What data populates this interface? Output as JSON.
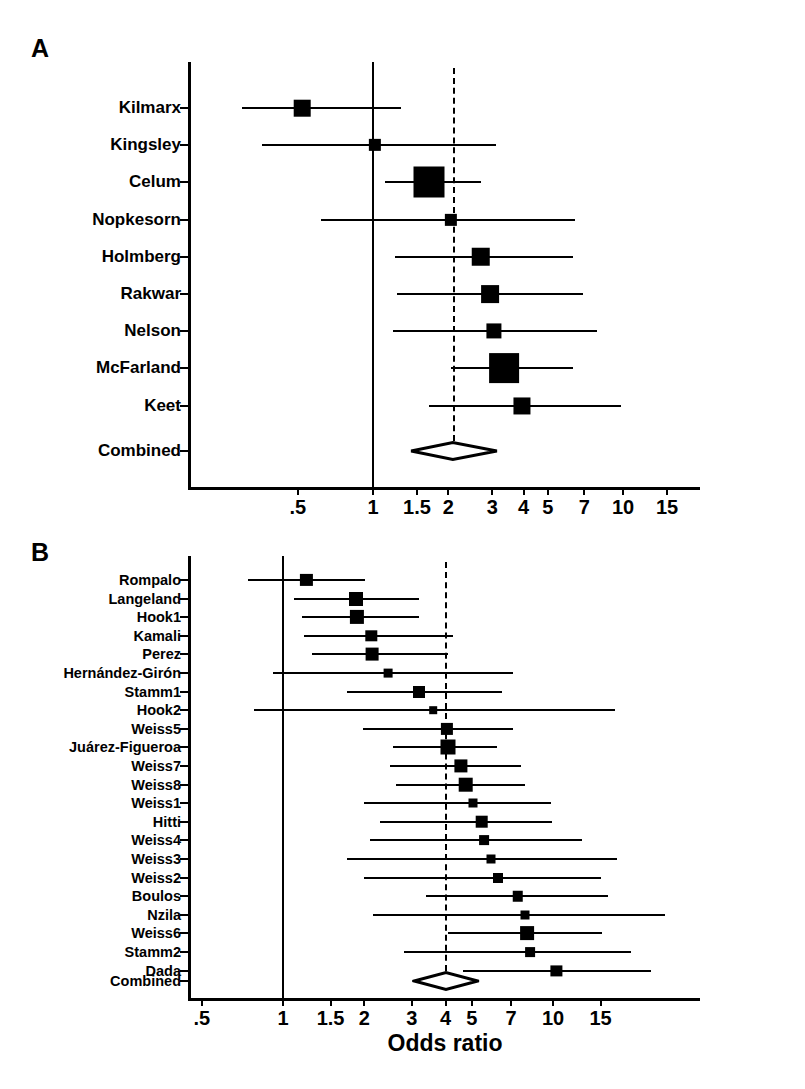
{
  "figure": {
    "axis_title": "Odds ratio",
    "caption": "Fig. 1. Summary of estimates of risk for human immunodeficiency virus infection"
  },
  "chart_data": [
    {
      "type": "forest",
      "panel": "A",
      "panel_letter": "A",
      "title": "",
      "xlabel": "",
      "ylabel": "",
      "xscale": "log",
      "xticks": [
        0.5,
        1,
        1.5,
        2,
        3,
        4,
        5,
        7,
        10,
        15
      ],
      "xtick_labels": [
        ".5",
        "1",
        "1.5",
        "2",
        "3",
        "4",
        "5",
        "7",
        "10",
        "15"
      ],
      "xlim": [
        0.28,
        17.5
      ],
      "reference_line": 1,
      "summary_line": 2.1,
      "categories": [
        "Kilmarx",
        "Kingsley",
        "Celum",
        "Nopkesorn",
        "Holmberg",
        "Rakwar",
        "Nelson",
        "McFarland",
        "Keet",
        "Combined"
      ],
      "points": [
        {
          "study": "Kilmarx",
          "or": 0.52,
          "lo": 0.3,
          "hi": 1.3,
          "weight": 0.4
        },
        {
          "study": "Kingsley",
          "or": 1.02,
          "lo": 0.36,
          "hi": 3.1,
          "weight": 0.22
        },
        {
          "study": "Celum",
          "or": 1.68,
          "lo": 1.12,
          "hi": 2.7,
          "weight": 1.0
        },
        {
          "study": "Nopkesorn",
          "or": 2.05,
          "lo": 0.62,
          "hi": 6.4,
          "weight": 0.22
        },
        {
          "study": "Holmberg",
          "or": 2.7,
          "lo": 1.22,
          "hi": 6.3,
          "weight": 0.48
        },
        {
          "study": "Rakwar",
          "or": 2.95,
          "lo": 1.25,
          "hi": 6.9,
          "weight": 0.45
        },
        {
          "study": "Nelson",
          "or": 3.05,
          "lo": 1.2,
          "hi": 7.9,
          "weight": 0.34
        },
        {
          "study": "McFarland",
          "or": 3.35,
          "lo": 2.05,
          "hi": 6.3,
          "weight": 0.95
        },
        {
          "study": "Keet",
          "or": 3.95,
          "lo": 1.68,
          "hi": 9.8,
          "weight": 0.42
        }
      ],
      "combined": {
        "study": "Combined",
        "or": 2.1,
        "lo": 1.43,
        "hi": 3.15
      }
    },
    {
      "type": "forest",
      "panel": "B",
      "panel_letter": "B",
      "title": "",
      "xlabel": "Odds ratio",
      "ylabel": "",
      "xscale": "log",
      "xticks": [
        0.5,
        1,
        1.5,
        2,
        3,
        4,
        5,
        7,
        10,
        15
      ],
      "xtick_labels": [
        ".5",
        "1",
        "1.5",
        "2",
        "3",
        "4",
        "5",
        "7",
        "10",
        "15"
      ],
      "xlim": [
        0.43,
        28
      ],
      "reference_line": 1,
      "summary_line": 4.0,
      "categories": [
        "Rompalo",
        "Langeland",
        "Hook1",
        "Kamali",
        "Perez",
        "Hernández-Girón",
        "Stamm1",
        "Hook2",
        "Weiss5",
        "Juárez-Figueroa",
        "Weiss7",
        "Weiss8",
        "Weiss1",
        "Hitti",
        "Weiss4",
        "Weiss3",
        "Weiss2",
        "Boulos",
        "Nzila",
        "Weiss6",
        "Stamm2",
        "Dada",
        "Combined"
      ],
      "points": [
        {
          "study": "Rompalo",
          "or": 1.22,
          "lo": 0.74,
          "hi": 2.02,
          "weight": 0.72
        },
        {
          "study": "Langeland",
          "or": 1.87,
          "lo": 1.1,
          "hi": 3.2,
          "weight": 0.9
        },
        {
          "study": "Hook1",
          "or": 1.88,
          "lo": 1.18,
          "hi": 3.2,
          "weight": 0.92
        },
        {
          "study": "Kamali",
          "or": 2.12,
          "lo": 1.2,
          "hi": 4.25,
          "weight": 0.64
        },
        {
          "study": "Perez",
          "or": 2.14,
          "lo": 1.28,
          "hi": 4.1,
          "weight": 0.78
        },
        {
          "study": "Hernández-Girón",
          "or": 2.45,
          "lo": 0.92,
          "hi": 7.1,
          "weight": 0.38
        },
        {
          "study": "Stamm1",
          "or": 3.2,
          "lo": 1.72,
          "hi": 6.5,
          "weight": 0.7
        },
        {
          "study": "Hook2",
          "or": 3.6,
          "lo": 0.78,
          "hi": 17.0,
          "weight": 0.26
        },
        {
          "study": "Weiss5",
          "or": 4.05,
          "lo": 1.98,
          "hi": 7.1,
          "weight": 0.72
        },
        {
          "study": "Juárez-Figueroa",
          "or": 4.1,
          "lo": 2.55,
          "hi": 6.2,
          "weight": 1.0
        },
        {
          "study": "Weiss7",
          "or": 4.55,
          "lo": 2.5,
          "hi": 7.6,
          "weight": 0.82
        },
        {
          "study": "Weiss8",
          "or": 4.75,
          "lo": 2.62,
          "hi": 7.9,
          "weight": 0.96
        },
        {
          "study": "Weiss1",
          "or": 5.05,
          "lo": 2.0,
          "hi": 9.8,
          "weight": 0.4
        },
        {
          "study": "Hitti",
          "or": 5.45,
          "lo": 2.28,
          "hi": 9.9,
          "weight": 0.76
        },
        {
          "study": "Weiss4",
          "or": 5.55,
          "lo": 2.1,
          "hi": 12.8,
          "weight": 0.48
        },
        {
          "study": "Weiss3",
          "or": 5.9,
          "lo": 1.72,
          "hi": 17.2,
          "weight": 0.4
        },
        {
          "study": "Weiss2",
          "or": 6.25,
          "lo": 2.0,
          "hi": 15.0,
          "weight": 0.5
        },
        {
          "study": "Boulos",
          "or": 7.4,
          "lo": 3.4,
          "hi": 16.0,
          "weight": 0.55
        },
        {
          "study": "Nzila",
          "or": 7.9,
          "lo": 2.15,
          "hi": 26.0,
          "weight": 0.4
        },
        {
          "study": "Weiss6",
          "or": 8.0,
          "lo": 4.1,
          "hi": 15.2,
          "weight": 0.88
        },
        {
          "study": "Stamm2",
          "or": 8.25,
          "lo": 2.8,
          "hi": 19.5,
          "weight": 0.48
        },
        {
          "study": "Dada",
          "or": 10.3,
          "lo": 4.65,
          "hi": 23.0,
          "weight": 0.62
        }
      ],
      "combined": {
        "study": "Combined",
        "or": 4.0,
        "lo": 3.05,
        "hi": 5.25
      }
    }
  ]
}
